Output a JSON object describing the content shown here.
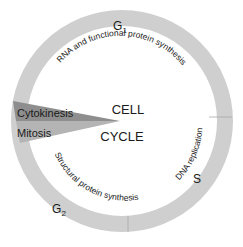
{
  "diagram": {
    "title_line1": "CELL",
    "title_line2": "CYCLE",
    "phases": [
      {
        "id": "g1",
        "label": "G",
        "subscript": "1",
        "activity": "RNA and functional protein synthesis"
      },
      {
        "id": "s",
        "label": "S",
        "subscript": "",
        "activity": "DNA replication"
      },
      {
        "id": "g2",
        "label": "G",
        "subscript": "2",
        "activity": "Structural protein synthesis"
      }
    ],
    "wedge": {
      "cytokinesis": "Cytokinesis",
      "mitosis": "Mitosis"
    },
    "colors": {
      "ring": "#cfcfcf",
      "divider": "#a8a8a8",
      "cytokinesis": "#8e8e8e",
      "mitosis": "#b4b4b4",
      "text": "#1a1a1a"
    }
  }
}
